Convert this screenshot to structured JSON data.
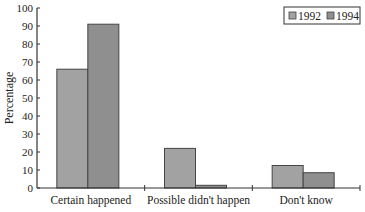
{
  "chart_data": {
    "type": "bar",
    "title": "",
    "xlabel": "",
    "ylabel": "Percentage",
    "ylim": [
      0,
      100
    ],
    "yticks": [
      0,
      10,
      20,
      30,
      40,
      50,
      60,
      70,
      80,
      90,
      100
    ],
    "grid": false,
    "legend_position": "top-right",
    "categories": [
      "Certain happened",
      "Possible didn't happen",
      "Don't know"
    ],
    "series": [
      {
        "name": "1992",
        "color": "#a2a2a2",
        "values": [
          66,
          22,
          12.5
        ]
      },
      {
        "name": "1994",
        "color": "#8f8f8f",
        "values": [
          91,
          1.5,
          8.5
        ]
      }
    ]
  }
}
